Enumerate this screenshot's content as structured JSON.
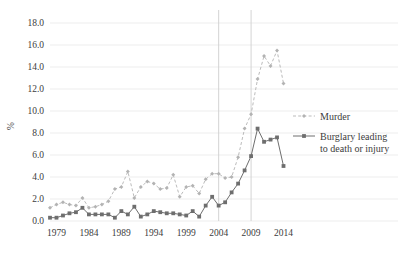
{
  "chart_data": {
    "type": "line",
    "title": "",
    "xlabel": "",
    "ylabel": "%",
    "ylim": [
      0.0,
      18.0
    ],
    "xlim": [
      1978,
      2015
    ],
    "ytick_labels": [
      "0.0",
      "2.0",
      "4.0",
      "6.0",
      "8.0",
      "10.0",
      "12.0",
      "14.0",
      "16.0",
      "18.0"
    ],
    "ytick_values": [
      0.0,
      2.0,
      4.0,
      6.0,
      8.0,
      10.0,
      12.0,
      14.0,
      16.0,
      18.0
    ],
    "xtick_labels": [
      "1979",
      "1984",
      "1989",
      "1994",
      "1999",
      "2004",
      "2009",
      "2014"
    ],
    "xtick_values": [
      1979,
      1984,
      1989,
      1994,
      1999,
      2004,
      2009,
      2014
    ],
    "grid": "horizontal",
    "legend_position": "right",
    "reference_lines": [
      2004,
      2009
    ],
    "x": [
      1978,
      1979,
      1980,
      1981,
      1982,
      1983,
      1984,
      1985,
      1986,
      1987,
      1988,
      1989,
      1990,
      1991,
      1992,
      1993,
      1994,
      1995,
      1996,
      1997,
      1998,
      1999,
      2000,
      2001,
      2002,
      2003,
      2004,
      2005,
      2006,
      2007,
      2008,
      2009,
      2010,
      2011,
      2012,
      2013,
      2014
    ],
    "series": [
      {
        "name": "Murder",
        "color": "#b3b3b3",
        "style": "dashed",
        "marker": "diamond",
        "values": [
          1.2,
          1.5,
          1.7,
          1.5,
          1.4,
          2.1,
          1.2,
          1.3,
          1.5,
          1.8,
          2.9,
          3.1,
          4.5,
          2.1,
          3.1,
          3.6,
          3.4,
          2.9,
          3.0,
          4.2,
          2.2,
          3.1,
          3.2,
          2.5,
          3.8,
          4.3,
          4.3,
          3.9,
          4.0,
          5.8,
          8.4,
          9.7,
          12.9,
          15.0,
          14.1,
          15.5,
          12.5
        ]
      },
      {
        "name": "Burglary leading to death or injury",
        "color": "#6e6e6e",
        "style": "solid",
        "marker": "square",
        "values": [
          0.3,
          0.3,
          0.5,
          0.7,
          0.8,
          1.2,
          0.6,
          0.6,
          0.6,
          0.6,
          0.3,
          0.9,
          0.6,
          1.3,
          0.4,
          0.6,
          0.9,
          0.8,
          0.7,
          0.7,
          0.6,
          0.5,
          0.9,
          0.4,
          1.4,
          2.2,
          1.4,
          1.7,
          2.6,
          3.4,
          4.6,
          5.9,
          8.4,
          7.2,
          7.4,
          7.6,
          5.0
        ]
      }
    ]
  },
  "legend": {
    "items": [
      {
        "label": "Murder"
      },
      {
        "label": "Burglary leading",
        "label2": "to death or injury"
      }
    ]
  }
}
